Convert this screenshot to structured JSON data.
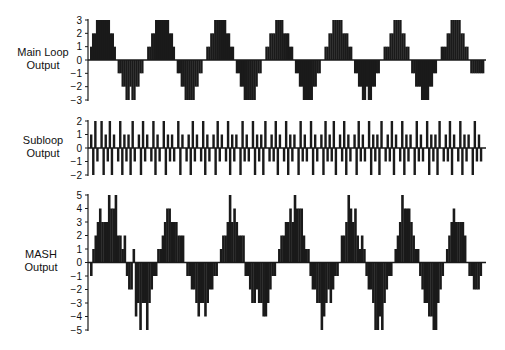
{
  "chart_data": [
    {
      "type": "bar",
      "title": "Main Loop Output",
      "ylabel": "Main Loop Output",
      "yticks": [
        3,
        2,
        1,
        0,
        -1,
        -2,
        -3
      ],
      "ylim": [
        -3,
        3
      ],
      "grid": false,
      "description": "Quantized staircase sinusoid, ~6.6 periods, levels -3..3",
      "period_samples": 30,
      "values": [
        1,
        2,
        2,
        3,
        3,
        3,
        3,
        3,
        3,
        3,
        2,
        2,
        1,
        0,
        -1,
        -1,
        -2,
        -2,
        -3,
        -3,
        -2,
        -3,
        -3,
        -2,
        -2,
        -1,
        -1,
        0,
        0,
        1,
        1,
        2,
        2,
        3,
        3,
        3,
        3,
        3,
        3,
        3,
        2,
        2,
        1,
        0,
        -1,
        -1,
        -2,
        -2,
        -3,
        -3,
        -3,
        -3,
        -3,
        -2,
        -2,
        -1,
        -1,
        0,
        0,
        1,
        1,
        2,
        2,
        3,
        3,
        3,
        3,
        3,
        3,
        2,
        2,
        1,
        1,
        0,
        -1,
        -1,
        -2,
        -2,
        -3,
        -3,
        -3,
        -3,
        -3,
        -3,
        -2,
        -1,
        -1,
        0,
        0,
        1,
        1,
        2,
        2,
        2,
        3,
        3,
        3,
        3,
        2,
        2,
        2,
        1,
        1,
        0,
        -1,
        -1,
        -2,
        -2,
        -3,
        -3,
        -3,
        -3,
        -3,
        -2,
        -2,
        -1,
        -1,
        0,
        0,
        1,
        1,
        2,
        2,
        3,
        3,
        3,
        3,
        3,
        2,
        2,
        2,
        1,
        1,
        0,
        -1,
        -1,
        -2,
        -2,
        -3,
        -3,
        -2,
        -3,
        -3,
        -2,
        -2,
        -1,
        -1,
        0,
        0,
        1,
        1,
        1,
        2,
        2,
        3,
        3,
        3,
        3,
        2,
        2,
        1,
        1,
        0,
        -1,
        -1,
        -2,
        -2,
        -2,
        -3,
        -3,
        -3,
        -3,
        -2,
        -2,
        -1,
        -1,
        0,
        0,
        1,
        1,
        1,
        2,
        2,
        3,
        3,
        3,
        3,
        3,
        2,
        2,
        1,
        1,
        0,
        -1,
        -1,
        -1,
        -1,
        -1,
        -1,
        -1
      ]
    },
    {
      "type": "bar",
      "title": "Subloop Output",
      "ylabel": "Subloop Output",
      "yticks": [
        2,
        1,
        0,
        -1,
        -2
      ],
      "ylim": [
        -2,
        2
      ],
      "grid": false,
      "description": "Noise-like subloop output alternating among -2..2",
      "values": [
        1,
        -2,
        2,
        -1,
        0,
        2,
        -2,
        1,
        -1,
        2,
        -2,
        1,
        0,
        -1,
        2,
        -2,
        1,
        -1,
        1,
        -2,
        2,
        -1,
        0,
        1,
        -2,
        2,
        -1,
        1,
        0,
        -1,
        2,
        -2,
        1,
        -1,
        0,
        2,
        -2,
        1,
        -1,
        1,
        -1,
        0,
        2,
        -2,
        1,
        0,
        -1,
        1,
        -2,
        2,
        -1,
        1,
        0,
        -1,
        2,
        -2,
        1,
        -1,
        0,
        1,
        -2,
        2,
        -1,
        1,
        0,
        -1,
        2,
        -2,
        1,
        -1,
        1,
        0,
        -2,
        2,
        -1,
        1,
        -1,
        0,
        2,
        -2,
        1,
        -1,
        1,
        -2,
        2,
        0,
        -1,
        1,
        -1,
        2,
        -2,
        1,
        0,
        -1,
        2,
        -2,
        1,
        -1,
        1,
        0,
        -2,
        2,
        -1,
        1,
        -1,
        0,
        2,
        -2,
        1,
        -1,
        0,
        1,
        -2,
        2,
        -1,
        1,
        -1,
        2,
        -2,
        0,
        1,
        -1,
        2,
        -2,
        1,
        -1,
        0,
        1,
        -2,
        2,
        -1,
        1,
        -1,
        0,
        2,
        -2,
        1,
        -1,
        1,
        -2,
        2,
        0,
        -1,
        1,
        -1,
        2,
        -2,
        1,
        0,
        -1,
        2,
        -2,
        1,
        -1,
        1,
        0,
        -2,
        2,
        -1,
        1,
        -1,
        0,
        2,
        -2,
        1,
        -1,
        1,
        -2,
        2,
        0,
        -1,
        1,
        -1,
        2,
        -2,
        1,
        0,
        -1,
        2,
        -2,
        1,
        -1,
        1,
        0,
        -2,
        2,
        -1,
        1,
        -1,
        0
      ]
    },
    {
      "type": "bar",
      "title": "MASH Output",
      "ylabel": "MASH Output",
      "yticks": [
        5,
        4,
        3,
        2,
        1,
        0,
        -1,
        -2,
        -3,
        -4,
        -5
      ],
      "ylim": [
        -5,
        5
      ],
      "grid": false,
      "description": "Sum of main loop and differentiated subloop: noisy staircase sinusoid, levels -5..5",
      "values": [
        -1,
        1,
        2,
        3,
        4,
        3,
        3,
        3,
        5,
        4,
        4,
        5,
        2,
        2,
        1,
        2,
        -1,
        -2,
        -2,
        1,
        -4,
        -3,
        -5,
        -3,
        -3,
        -5,
        -3,
        -2,
        -1,
        -1,
        1,
        1,
        2,
        3,
        4,
        4,
        3,
        3,
        3,
        2,
        2,
        2,
        0,
        -1,
        -1,
        -2,
        -2,
        -3,
        -4,
        -3,
        -3,
        -4,
        -3,
        -2,
        -2,
        -1,
        -1,
        0,
        1,
        2,
        2,
        3,
        5,
        3,
        4,
        3,
        2,
        2,
        2,
        -1,
        -1,
        -2,
        -3,
        -3,
        -2,
        -3,
        -3,
        -4,
        -4,
        -3,
        -2,
        -1,
        -1,
        0,
        1,
        2,
        2,
        3,
        3,
        4,
        3,
        5,
        4,
        4,
        4,
        2,
        1,
        1,
        -1,
        -2,
        -2,
        -3,
        -3,
        -5,
        -4,
        -3,
        -2,
        -3,
        -2,
        -1,
        -1,
        0,
        2,
        2,
        3,
        5,
        4,
        3,
        4,
        2,
        1,
        2,
        1,
        -1,
        -2,
        -2,
        -3,
        -5,
        -5,
        -4,
        -5,
        -3,
        -2,
        -1,
        -1,
        0,
        1,
        2,
        3,
        5,
        4,
        4,
        4,
        3,
        2,
        1,
        1,
        -1,
        -2,
        -3,
        -3,
        -4,
        -4,
        -5,
        -5,
        -3,
        -2,
        -1,
        0,
        1,
        2,
        3,
        4,
        3,
        3,
        3,
        3,
        2,
        0,
        -1,
        -1,
        -2,
        -2,
        -2,
        -1,
        0
      ]
    }
  ],
  "labels": {
    "main": [
      "Main Loop",
      "Output"
    ],
    "sub": [
      "Subloop",
      "Output"
    ],
    "mash": [
      "MASH",
      "Output"
    ]
  },
  "colors": {
    "ink": "#1a1a1a",
    "background": "#ffffff"
  }
}
